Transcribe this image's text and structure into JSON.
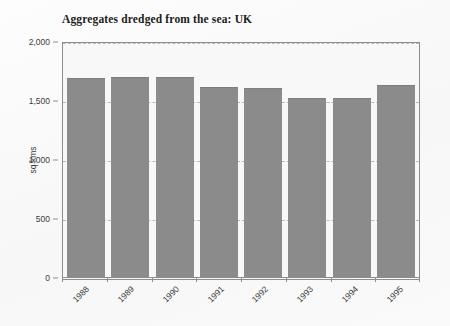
{
  "chart_data": {
    "type": "bar",
    "title": "Aggregates dredged from the sea: UK",
    "xlabel": "",
    "ylabel": "sq kms",
    "categories": [
      "1988",
      "1989",
      "1990",
      "1991",
      "1992",
      "1993",
      "1994",
      "1995"
    ],
    "values": [
      1684,
      1695,
      1695,
      1613,
      1605,
      1514,
      1514,
      1624
    ],
    "ylim": [
      0,
      2000
    ],
    "ytick_values": [
      0,
      500,
      1000,
      1500,
      2000
    ],
    "ytick_labels": [
      "0",
      "500",
      "1,000",
      "1,500",
      "2,000"
    ],
    "grid": true,
    "legend": "none",
    "bar_color": "#8b8b8b",
    "plot_background": "#f8f8f8",
    "axis_color": "#8d8d8d",
    "gridline_color": "#b9b9b9",
    "text_color": "#3b3b3b",
    "xtick_rotation": -45
  }
}
